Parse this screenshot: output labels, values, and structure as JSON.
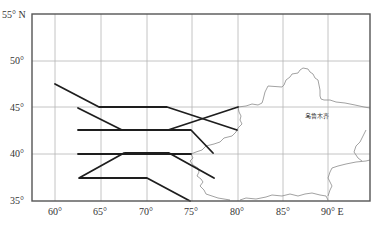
{
  "map": {
    "lon_ticks": [
      {
        "label": "60°",
        "lon": 60
      },
      {
        "label": "65°",
        "lon": 65
      },
      {
        "label": "70°",
        "lon": 70
      },
      {
        "label": "75°",
        "lon": 75
      },
      {
        "label": "80°",
        "lon": 80
      },
      {
        "label": "85°",
        "lon": 85
      },
      {
        "label": "90° E",
        "lon": 90
      }
    ],
    "lat_ticks": [
      {
        "label": "55° N",
        "lat": 55
      },
      {
        "label": "50°",
        "lat": 50
      },
      {
        "label": "45°",
        "lat": 45
      },
      {
        "label": "40°",
        "lat": 40
      },
      {
        "label": "35°",
        "lat": 35
      }
    ],
    "extent": {
      "lon_min": 57.5,
      "lon_max": 95,
      "lat_min": 35,
      "lat_max": 55
    },
    "city_label": "乌鲁木齐",
    "colors": {
      "track": "#1e1e1e",
      "grid": "#b5b5b5",
      "border": "#8a8a8a",
      "frame": "#555555"
    }
  }
}
